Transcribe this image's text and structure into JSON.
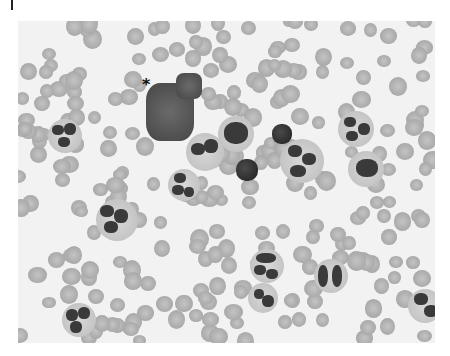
{
  "figure": {
    "type": "grayscale peripheral blood smear micrograph",
    "annotation": {
      "label": "*",
      "x": 142,
      "y": 78
    },
    "background_color": "#f2f2f2",
    "rbc_color": "#a9a9a9",
    "nucleus_color": "#3a3a3a"
  }
}
